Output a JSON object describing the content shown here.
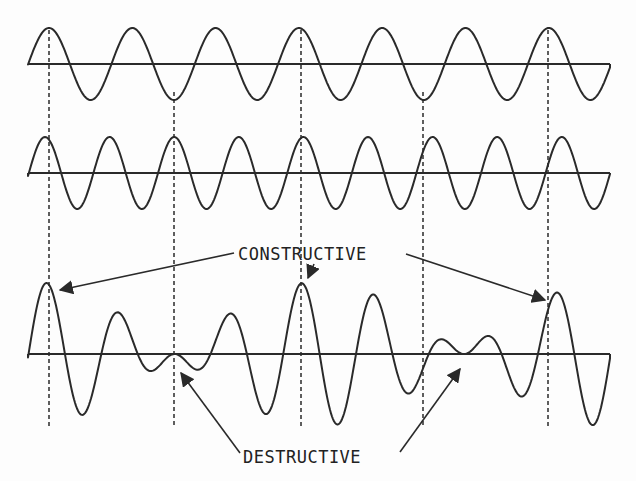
{
  "diagram": {
    "title": "",
    "labels": {
      "constructive": "CONSTRUCTIVE",
      "destructive": "DESTRUCTIVE"
    },
    "colors": {
      "ink": "#2a2a2a",
      "background": "#fdfdfd"
    }
  },
  "chart_data": {
    "type": "line",
    "title": "",
    "xlabel": "",
    "ylabel": "",
    "grid": false,
    "series": [
      {
        "name": "wave-1",
        "x_start": 28,
        "x_end": 610,
        "axis_y": 64,
        "amplitude": 36,
        "period_px": 83.3,
        "first_peak_x": 49
      },
      {
        "name": "wave-2",
        "x_start": 28,
        "x_end": 610,
        "axis_y": 173,
        "amplitude": 36,
        "period_px": 64.6,
        "first_peak_x": 45
      },
      {
        "name": "sum",
        "x_start": 28,
        "x_end": 610,
        "axis_y": 354,
        "amplitude_scale": 1.0
      }
    ],
    "reference_lines_x": [
      49,
      174,
      301,
      423,
      548
    ],
    "annotations": [
      {
        "text": "CONSTRUCTIVE",
        "points_to_x": [
          49,
          301,
          548
        ]
      },
      {
        "text": "DESTRUCTIVE",
        "points_to_x": [
          174,
          448
        ]
      }
    ]
  }
}
